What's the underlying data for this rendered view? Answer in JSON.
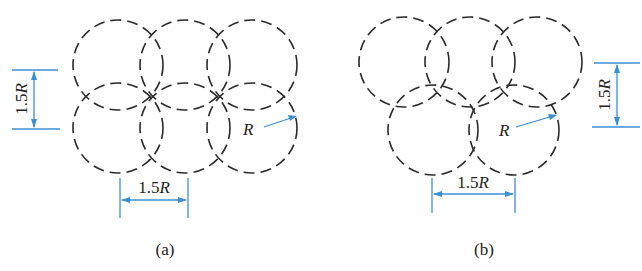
{
  "figure": {
    "panel_a": {
      "caption": "(a)",
      "layout": "square arrangement (2 rows × 3 columns)",
      "radius_label": "R",
      "horizontal_spacing_label": "1.5R",
      "vertical_spacing_label": "1.5R",
      "circles": [
        {
          "row": 1,
          "col": 1,
          "cx": 118,
          "cy": 65
        },
        {
          "row": 1,
          "col": 2,
          "cx": 185,
          "cy": 65
        },
        {
          "row": 1,
          "col": 3,
          "cx": 252,
          "cy": 65
        },
        {
          "row": 2,
          "col": 1,
          "cx": 118,
          "cy": 128
        },
        {
          "row": 2,
          "col": 2,
          "cx": 185,
          "cy": 128
        },
        {
          "row": 2,
          "col": 3,
          "cx": 252,
          "cy": 128
        }
      ],
      "radius_px": 45
    },
    "panel_b": {
      "caption": "(b)",
      "layout": "staggered (triangular) arrangement: 3 circles top, 2 circles bottom",
      "radius_label": "R",
      "horizontal_spacing_label": "1.5R",
      "vertical_spacing_label": "1.5R",
      "circles": [
        {
          "row": 1,
          "col": 1,
          "cx": 404,
          "cy": 62
        },
        {
          "row": 1,
          "col": 2,
          "cx": 470,
          "cy": 62
        },
        {
          "row": 1,
          "col": 3,
          "cx": 537,
          "cy": 62
        },
        {
          "row": 2,
          "col": 1,
          "cx": 433,
          "cy": 130
        },
        {
          "row": 2,
          "col": 2,
          "cx": 514,
          "cy": 130
        }
      ],
      "radius_px": 45
    },
    "colors": {
      "circle_stroke": "#2b2b2b",
      "dimension_line": "#3a8fd8",
      "text": "#222222"
    }
  }
}
